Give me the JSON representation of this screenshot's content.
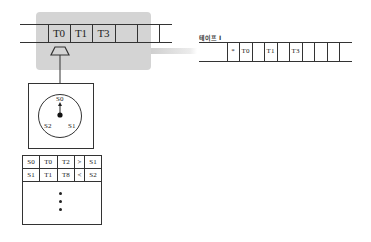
{
  "diagram": {
    "type": "turing-machine",
    "main_tape": {
      "cells": [
        "T0",
        "T1",
        "T3",
        "",
        "",
        ""
      ]
    },
    "zoomed_tape": {
      "label": "테이프 I",
      "cells": [
        "",
        "*",
        "T0",
        "",
        "T1",
        "",
        "T3",
        "",
        "",
        "",
        ""
      ]
    },
    "head": {
      "shape": "trapezoid"
    },
    "state_dial": {
      "labels": {
        "top": "S0",
        "left": "S2",
        "right": "S1"
      },
      "pointer": "S0"
    },
    "rule_table": {
      "rows": [
        [
          "S0",
          "T0",
          "T2",
          ">",
          "S1"
        ],
        [
          "S1",
          "T1",
          "T8",
          "<",
          "S2"
        ]
      ],
      "continuation": "⋮"
    },
    "colors": {
      "highlight": "#d4d4d4",
      "line": "#333333"
    }
  }
}
